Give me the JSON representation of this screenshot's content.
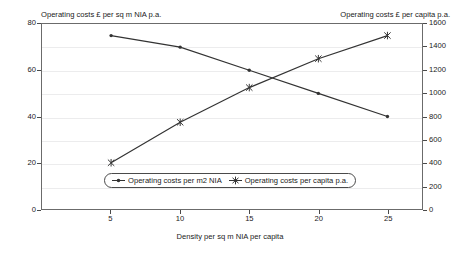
{
  "chart_data": {
    "type": "line",
    "title": "",
    "xlabel": "Density per sq m NIA per capita",
    "ylabel": "Operating costs £ per sq m NIA p.a.",
    "y2label": "Operating costs £ per capita p.a.",
    "x": [
      5,
      10,
      15,
      20,
      25
    ],
    "xlim": [
      0,
      27.5
    ],
    "xticks": [
      "5",
      "10",
      "15",
      "20",
      "25"
    ],
    "ylim": [
      0,
      80
    ],
    "yticks": [
      "0",
      "20",
      "40",
      "60",
      "80"
    ],
    "y_minor_step": 10,
    "y2lim": [
      0,
      1600
    ],
    "y2ticks": [
      "0",
      "200",
      "400",
      "600",
      "800",
      "1000",
      "1200",
      "1400",
      "1600"
    ],
    "grid": true,
    "legend_position": "inside-bottom-center",
    "series": [
      {
        "name": "Operating costs per m2 NIA",
        "axis": "left",
        "marker": "dot",
        "values": [
          75,
          70,
          60,
          50,
          40
        ]
      },
      {
        "name": "Operating costs per capita p.a.",
        "axis": "right",
        "marker": "cross",
        "values": [
          400,
          750,
          1050,
          1300,
          1500
        ]
      }
    ],
    "line_color": "#333333"
  },
  "legend": {
    "items": [
      {
        "label": "Operating costs per m2 NIA",
        "marker": "dot-line-marker"
      },
      {
        "label": "Operating costs per capita p.a.",
        "marker": "cross-line-marker"
      }
    ]
  }
}
